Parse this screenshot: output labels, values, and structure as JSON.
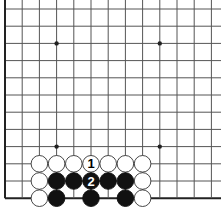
{
  "diagram": {
    "type": "go-board-fragment",
    "grid": {
      "cols": 13,
      "rows": 12,
      "origin_x": 5,
      "origin_y": 9,
      "spacing": 17.2,
      "right_open": true,
      "top_open": true
    },
    "colors": {
      "line": "#555555",
      "edge": "#222222",
      "black": "#111111",
      "white": "#ffffff",
      "stone_outline": "#333333"
    },
    "star_points": [
      [
        3,
        2
      ],
      [
        9,
        2
      ],
      [
        3,
        8
      ],
      [
        9,
        8
      ]
    ],
    "stones": [
      {
        "c": 2,
        "r": 9,
        "color": "white"
      },
      {
        "c": 3,
        "r": 9,
        "color": "white"
      },
      {
        "c": 4,
        "r": 9,
        "color": "white"
      },
      {
        "c": 5,
        "r": 9,
        "color": "white",
        "label": "1"
      },
      {
        "c": 6,
        "r": 9,
        "color": "white"
      },
      {
        "c": 7,
        "r": 9,
        "color": "white"
      },
      {
        "c": 8,
        "r": 9,
        "color": "white"
      },
      {
        "c": 2,
        "r": 10,
        "color": "white"
      },
      {
        "c": 3,
        "r": 10,
        "color": "black"
      },
      {
        "c": 4,
        "r": 10,
        "color": "black"
      },
      {
        "c": 5,
        "r": 10,
        "color": "black",
        "label": "2"
      },
      {
        "c": 6,
        "r": 10,
        "color": "black"
      },
      {
        "c": 7,
        "r": 10,
        "color": "black"
      },
      {
        "c": 8,
        "r": 10,
        "color": "white"
      },
      {
        "c": 2,
        "r": 11,
        "color": "white"
      },
      {
        "c": 3,
        "r": 11,
        "color": "black"
      },
      {
        "c": 5,
        "r": 11,
        "color": "black"
      },
      {
        "c": 7,
        "r": 11,
        "color": "black"
      },
      {
        "c": 8,
        "r": 11,
        "color": "white"
      }
    ]
  }
}
